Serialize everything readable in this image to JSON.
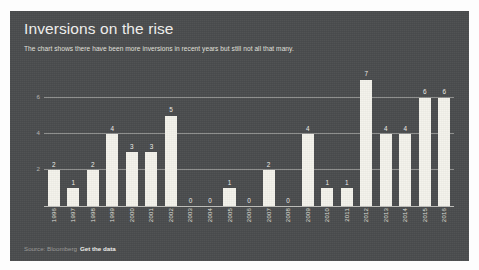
{
  "card": {
    "title": "Inversions on the rise",
    "subtitle": "The chart shows there have been more inversions in recent years but still not all that many.",
    "background_color": "#4a4c4e",
    "bar_color": "#f4f3ec",
    "text_color": "#f2f2f0"
  },
  "footer": {
    "source": "Source: Bloomberg",
    "link_label": "Get the data"
  },
  "chart_data": {
    "type": "bar",
    "title": "Inversions on the rise",
    "subtitle": "The chart shows there have been more inversions in recent years but still not all that many.",
    "xlabel": "",
    "ylabel": "",
    "ylim": [
      0,
      7.6
    ],
    "grid": true,
    "gridlines": [
      2,
      4,
      6
    ],
    "ytick_labels": [
      "2",
      "4",
      "6"
    ],
    "legend": false,
    "categories": [
      "1996",
      "1997",
      "1998",
      "1999",
      "2000",
      "2001",
      "2002",
      "2003",
      "2004",
      "2005",
      "2006",
      "2007",
      "2008",
      "2009",
      "2010",
      "2011",
      "2012",
      "2013",
      "2014",
      "2015",
      "2016"
    ],
    "values": [
      2,
      1,
      2,
      4,
      3,
      3,
      5,
      0,
      0,
      1,
      0,
      2,
      0,
      4,
      1,
      1,
      7,
      4,
      4,
      6,
      6
    ],
    "value_labels": [
      "2",
      "1",
      "2",
      "4",
      "3",
      "3",
      "5",
      "0",
      "0",
      "1",
      "0",
      "2",
      "0",
      "4",
      "1",
      "1",
      "7",
      "4",
      "4",
      "6",
      "6"
    ]
  }
}
